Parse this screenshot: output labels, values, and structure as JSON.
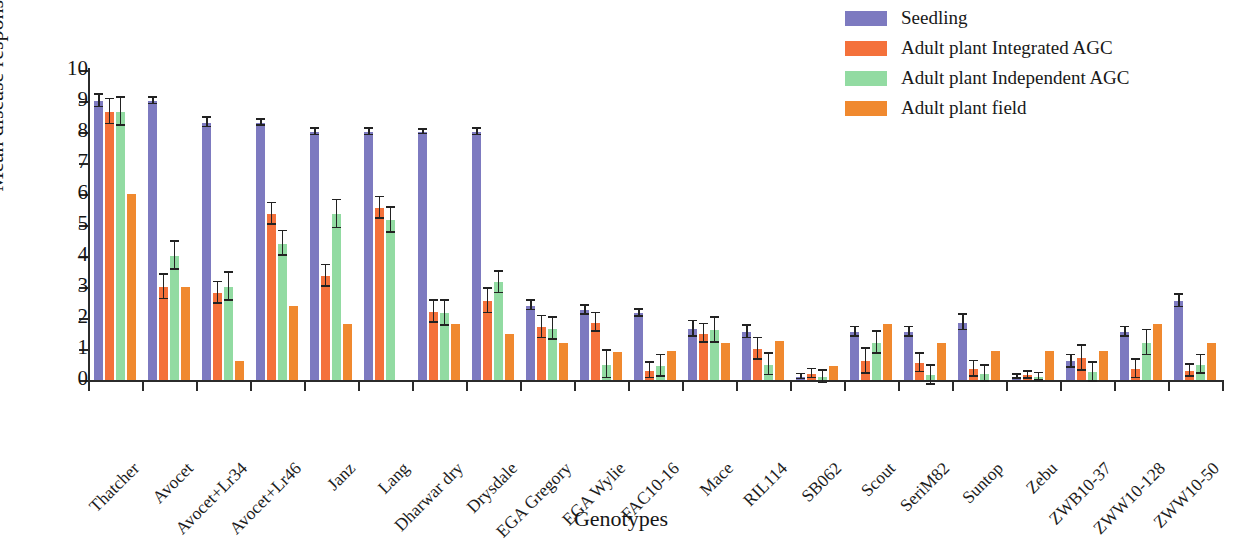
{
  "chart_data": {
    "type": "bar",
    "title": "",
    "xlabel": "Genotypes",
    "ylabel": "Mean disease response",
    "ylim": [
      0,
      10
    ],
    "yticks": [
      0,
      1,
      2,
      3,
      4,
      5,
      6,
      7,
      8,
      9,
      10
    ],
    "grid": false,
    "legend_position": "top-right",
    "categories": [
      "Thatcher",
      "Avocet",
      "Avocet+Lr34",
      "Avocet+Lr46",
      "Janz",
      "Lang",
      "Dharwar dry",
      "Drysdale",
      "EGA Gregory",
      "EGA Wylie",
      "FAC10-16",
      "Mace",
      "RIL114",
      "SB062",
      "Scout",
      "SeriM82",
      "Suntop",
      "Zebu",
      "ZWB10-37",
      "ZWW10-128",
      "ZWW10-50"
    ],
    "series": [
      {
        "name": "Seedling",
        "color": "#7d7ac0",
        "values": [
          9.0,
          9.0,
          8.3,
          8.3,
          8.0,
          8.0,
          8.0,
          8.0,
          2.4,
          2.25,
          2.15,
          1.65,
          1.55,
          0.1,
          1.55,
          1.55,
          1.85,
          0.1,
          0.6,
          1.55,
          2.55
        ],
        "errors": [
          0.2,
          0.1,
          0.15,
          0.1,
          0.1,
          0.1,
          0.08,
          0.1,
          0.15,
          0.15,
          0.12,
          0.25,
          0.2,
          0.08,
          0.15,
          0.15,
          0.25,
          0.06,
          0.2,
          0.15,
          0.2
        ]
      },
      {
        "name": "Adult plant Integrated AGC",
        "color": "#f4713b",
        "values": [
          8.65,
          3.0,
          2.8,
          5.35,
          3.35,
          5.55,
          2.2,
          2.55,
          1.7,
          1.85,
          0.3,
          1.5,
          1.0,
          0.2,
          0.6,
          0.55,
          0.35,
          0.15,
          0.7,
          0.35,
          0.3
        ],
        "errors": [
          0.4,
          0.4,
          0.35,
          0.35,
          0.35,
          0.35,
          0.35,
          0.4,
          0.35,
          0.3,
          0.25,
          0.3,
          0.35,
          0.15,
          0.4,
          0.3,
          0.25,
          0.12,
          0.4,
          0.3,
          0.2
        ]
      },
      {
        "name": "Adult plant Independent AGC",
        "color": "#92dba2",
        "values": [
          8.65,
          4.0,
          3.0,
          4.4,
          5.35,
          5.15,
          2.15,
          3.15,
          1.65,
          0.5,
          0.45,
          1.6,
          0.5,
          0.1,
          1.2,
          0.15,
          0.2,
          0.1,
          0.25,
          1.2,
          0.5
        ],
        "errors": [
          0.45,
          0.45,
          0.45,
          0.4,
          0.45,
          0.4,
          0.4,
          0.35,
          0.35,
          0.45,
          0.35,
          0.4,
          0.35,
          0.2,
          0.35,
          0.3,
          0.25,
          0.12,
          0.3,
          0.4,
          0.3
        ]
      },
      {
        "name": "Adult plant field",
        "color": "#f0892f",
        "values": [
          6.0,
          3.0,
          0.6,
          2.4,
          1.8,
          0.0,
          1.8,
          1.5,
          1.2,
          0.9,
          0.95,
          1.2,
          1.25,
          0.45,
          1.8,
          1.2,
          0.95,
          0.95,
          0.95,
          1.8,
          1.2
        ],
        "errors": [
          0,
          0,
          0,
          0,
          0,
          0,
          0,
          0,
          0,
          0,
          0,
          0,
          0,
          0,
          0,
          0,
          0,
          0,
          0,
          0,
          0
        ]
      }
    ]
  },
  "axes": {
    "ylabel": "Mean disease response",
    "xlabel": "Genotypes",
    "ytick_labels": [
      "0",
      "1",
      "2",
      "3",
      "4",
      "5",
      "6",
      "7",
      "8",
      "9",
      "10"
    ]
  },
  "legend": {
    "items": [
      {
        "label": "Seedling",
        "color": "#7d7ac0"
      },
      {
        "label": "Adult plant Integrated AGC",
        "color": "#f4713b"
      },
      {
        "label": "Adult plant Independent AGC",
        "color": "#92dba2"
      },
      {
        "label": "Adult plant field",
        "color": "#f0892f"
      }
    ]
  }
}
